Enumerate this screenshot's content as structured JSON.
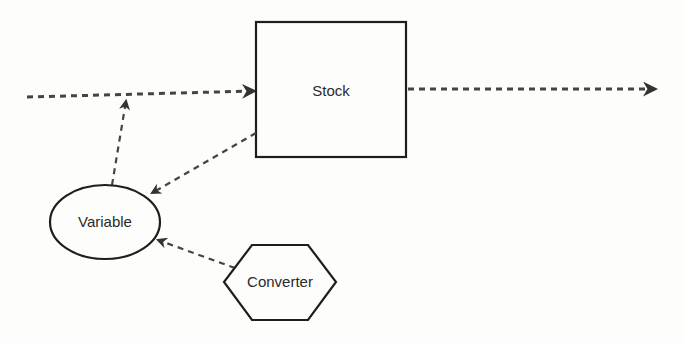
{
  "diagram": {
    "type": "stock-flow system dynamics diagram",
    "nodes": [
      {
        "id": "stock",
        "label": "Stock",
        "shape": "rectangle"
      },
      {
        "id": "variable",
        "label": "Variable",
        "shape": "ellipse"
      },
      {
        "id": "converter",
        "label": "Converter",
        "shape": "hexagon"
      }
    ],
    "edges": [
      {
        "from": "source",
        "to": "stock",
        "style": "dashed-thick",
        "kind": "inflow"
      },
      {
        "from": "stock",
        "to": "sink",
        "style": "dashed-thick",
        "kind": "outflow"
      },
      {
        "from": "stock",
        "to": "variable",
        "style": "dashed",
        "kind": "link"
      },
      {
        "from": "variable",
        "to": "inflow",
        "style": "dashed",
        "kind": "link"
      },
      {
        "from": "converter",
        "to": "variable",
        "style": "dashed",
        "kind": "link"
      }
    ],
    "colors": {
      "stroke": "#1e1e1e",
      "dash": "#444444",
      "background": "#fdfdfb"
    }
  }
}
